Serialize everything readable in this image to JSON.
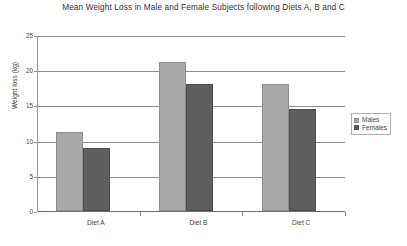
{
  "chart_data": {
    "type": "bar",
    "title": "Mean Weight Loss in Male and Female Subjects following Diets A, B and C",
    "xlabel": "",
    "ylabel": "Weight loss (kg)",
    "categories": [
      "Diet A",
      "Diet B",
      "Diet C"
    ],
    "series": [
      {
        "name": "Males",
        "color": "#a9a9a9",
        "values": [
          11.2,
          21.1,
          18.1
        ]
      },
      {
        "name": "Females",
        "color": "#5e5e5e",
        "values": [
          9.0,
          18.0,
          14.5
        ]
      }
    ],
    "ylim": [
      0,
      25
    ],
    "yticks": [
      0,
      5,
      10,
      15,
      20,
      25
    ],
    "ytick_labels": [
      "0",
      "5",
      "10",
      "15",
      "20",
      "25"
    ],
    "grid": true,
    "legend_position": "right"
  }
}
